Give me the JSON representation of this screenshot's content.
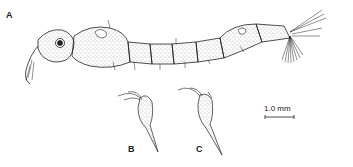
{
  "figure": {
    "panels": [
      {
        "id": "A",
        "label": "A",
        "description": "larva, lateral view"
      },
      {
        "id": "B",
        "label": "B",
        "description": "appendage detail"
      },
      {
        "id": "C",
        "label": "C",
        "description": "appendage detail"
      }
    ],
    "scale_bar": {
      "label": "1.0 mm"
    },
    "colors": {
      "ink": "#222222",
      "stipple": "#555555",
      "background": "#ffffff"
    }
  }
}
